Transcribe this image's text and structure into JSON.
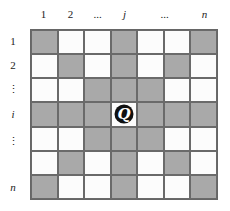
{
  "column_labels": [
    "1",
    "2",
    "...",
    "j",
    "...",
    "n"
  ],
  "row_labels": [
    "1",
    "2",
    "⋮",
    "i",
    "⋮",
    "n"
  ],
  "grid": {
    "rows": 7,
    "cols": 7,
    "shaded_color": "#a9a9a9",
    "empty_color": "#fcfcfc",
    "pattern": [
      "gwwgwwg",
      "wgwgwgw",
      "wwgggww",
      "gggQggg",
      "wwgggww",
      "wgwgwgw",
      "gwwgwwg"
    ]
  },
  "queen": {
    "label": "Q",
    "row": 4,
    "col": 4,
    "icon": "queen-icon"
  }
}
